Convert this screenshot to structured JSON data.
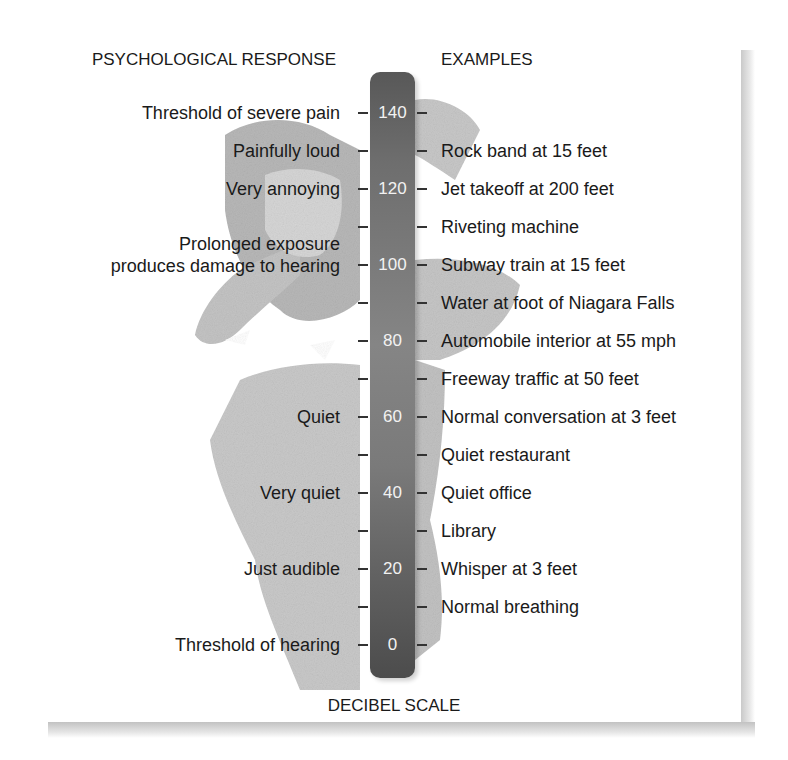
{
  "headers": {
    "left": "PSYCHOLOGICAL RESPONSE",
    "right": "EXAMPLES",
    "bottom": "DECIBEL SCALE"
  },
  "scale": {
    "min": 0,
    "max": 140,
    "step": 10,
    "labeled_values": [
      "140",
      "120",
      "100",
      "80",
      "60",
      "40",
      "20",
      "0"
    ]
  },
  "psychological_responses": [
    {
      "db": 140,
      "label": "Threshold of severe pain"
    },
    {
      "db": 130,
      "label": "Painfully loud"
    },
    {
      "db": 120,
      "label": "Very annoying"
    },
    {
      "db": 100,
      "label": "Prolonged exposure\nproduces damage to hearing"
    },
    {
      "db": 60,
      "label": "Quiet"
    },
    {
      "db": 40,
      "label": "Very quiet"
    },
    {
      "db": 20,
      "label": "Just audible"
    },
    {
      "db": 0,
      "label": "Threshold of hearing"
    }
  ],
  "examples": [
    {
      "db": 130,
      "label": "Rock band at 15 feet"
    },
    {
      "db": 120,
      "label": "Jet takeoff at 200 feet"
    },
    {
      "db": 110,
      "label": "Riveting machine"
    },
    {
      "db": 100,
      "label": "Subway train at 15 feet"
    },
    {
      "db": 90,
      "label": "Water at foot of Niagara Falls"
    },
    {
      "db": 80,
      "label": "Automobile interior at 55 mph"
    },
    {
      "db": 70,
      "label": "Freeway traffic at 50 feet"
    },
    {
      "db": 60,
      "label": "Normal conversation at 3 feet"
    },
    {
      "db": 50,
      "label": "Quiet restaurant"
    },
    {
      "db": 40,
      "label": "Quiet office"
    },
    {
      "db": 30,
      "label": "Library"
    },
    {
      "db": 20,
      "label": "Whisper at 3 feet"
    },
    {
      "db": 10,
      "label": "Normal breathing"
    }
  ],
  "colors": {
    "bar_dark": "#4c4c4c",
    "bar_light": "#858585",
    "bar_text": "#f2f2f2",
    "text": "#1a1a1a",
    "photo_gray": "#c8c8c8"
  },
  "illustration": "person-covering-ears-photo"
}
